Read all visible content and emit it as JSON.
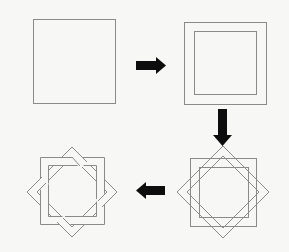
{
  "diagram": {
    "colors": {
      "background": "#f7f7f6",
      "line": "#8a8a8a",
      "arrow": "#0d0d0d",
      "band_fill": "#f7f7f6"
    },
    "steps": [
      {
        "id": 1,
        "label": "Square"
      },
      {
        "id": 2,
        "label": "Square with inner offset square (band)"
      },
      {
        "id": 3,
        "label": "Band duplicated and rotated 45°"
      },
      {
        "id": 4,
        "label": "Interlaced eight-pointed star"
      }
    ],
    "arrows": [
      {
        "from": 1,
        "to": 2,
        "direction": "right"
      },
      {
        "from": 2,
        "to": 3,
        "direction": "down"
      },
      {
        "from": 3,
        "to": 4,
        "direction": "left"
      }
    ]
  }
}
